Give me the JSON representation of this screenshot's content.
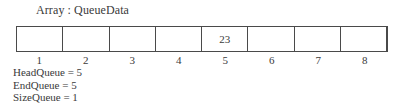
{
  "title": "Array : QueueData",
  "array": {
    "name": "QueueData",
    "cells": [
      "",
      "",
      "",
      "",
      "23",
      "",
      "",
      ""
    ],
    "indices": [
      "1",
      "2",
      "3",
      "4",
      "5",
      "6",
      "7",
      "8"
    ]
  },
  "variables": [
    {
      "name": "HeadQueue",
      "value": "5",
      "text": "HeadQueue = 5"
    },
    {
      "name": "EndQueue",
      "value": "5",
      "text": "EndQueue = 5"
    },
    {
      "name": "SizeQueue",
      "value": "1",
      "text": "SizeQueue = 1"
    }
  ]
}
